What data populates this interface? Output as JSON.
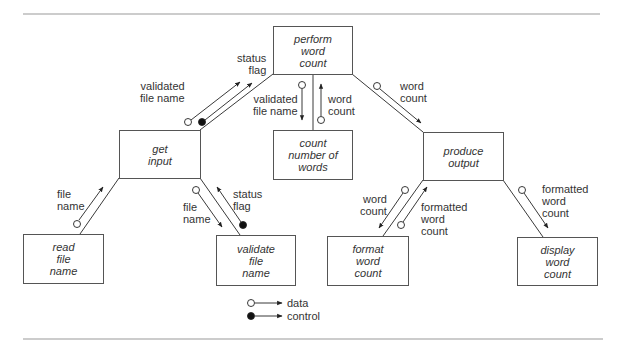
{
  "diagram": {
    "type": "structure-chart",
    "modules": {
      "perform": [
        "perform",
        "word",
        "count"
      ],
      "get_input": [
        "get",
        "input"
      ],
      "count_words": [
        "count",
        "number of",
        "words"
      ],
      "produce_output": [
        "produce",
        "output"
      ],
      "read_file_name": [
        "read",
        "file",
        "name"
      ],
      "validate_file_name": [
        "validate",
        "file",
        "name"
      ],
      "format_word_count": [
        "format",
        "word",
        "count"
      ],
      "display_word_count": [
        "display",
        "word",
        "count"
      ]
    },
    "couples": {
      "get_to_perform_data": [
        "validated",
        "file name"
      ],
      "get_to_perform_control": [
        "status",
        "flag"
      ],
      "perform_to_count_data": [
        "validated",
        "file name"
      ],
      "count_to_perform_data": [
        "word",
        "count"
      ],
      "perform_to_produce_data": [
        "word",
        "count"
      ],
      "read_to_get_data": [
        "file",
        "name"
      ],
      "get_to_validate_data": [
        "file",
        "name"
      ],
      "validate_to_get_control": [
        "status",
        "flag"
      ],
      "produce_to_format_data": [
        "word",
        "count"
      ],
      "format_to_produce_data": [
        "formatted",
        "word",
        "count"
      ],
      "produce_to_display_data": [
        "formatted",
        "word",
        "count"
      ]
    },
    "legend": {
      "data": "data",
      "control": "control"
    }
  },
  "colors": {
    "line": "#3a3a3a",
    "rule": "#9a9a9a",
    "box_border": "#555555",
    "control_fill": "#111111"
  }
}
